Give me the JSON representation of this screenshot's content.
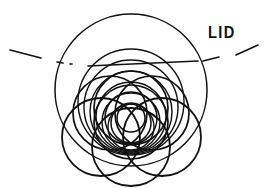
{
  "figure": {
    "title": "LID",
    "type": "technical-line-drawing",
    "background_color": "#ffffff",
    "ink_color": "#111111",
    "label": {
      "text": "LID",
      "x": 208,
      "y": 24,
      "font_size": 17,
      "weight": "bold"
    },
    "centerline": {
      "name": "dash-dot-centerline",
      "style": "dash-dot",
      "color": "#111111",
      "stroke_width": 1.6,
      "segments": [
        {
          "x1": 10,
          "y1": 50,
          "x2": 41,
          "y2": 58
        },
        {
          "x1": 57,
          "y1": 62,
          "x2": 63,
          "y2": 63
        },
        {
          "x1": 70,
          "y1": 64,
          "x2": 72,
          "y2": 64
        },
        {
          "x1": 88,
          "y1": 66,
          "x2": 198,
          "y2": 61
        },
        {
          "x1": 203,
          "y1": 61,
          "x2": 219,
          "y2": 57
        },
        {
          "x1": 236,
          "y1": 55,
          "x2": 258,
          "y2": 45
        }
      ]
    },
    "circles": [
      {
        "name": "outer-boundary-circle",
        "cx": 131,
        "cy": 90,
        "r": 76,
        "stroke_width": 1.5
      },
      {
        "name": "upper-nested-circle-1",
        "cx": 131,
        "cy": 102,
        "r": 53,
        "stroke_width": 1.4
      },
      {
        "name": "upper-nested-circle-2",
        "cx": 131,
        "cy": 107,
        "r": 47,
        "stroke_width": 1.4
      },
      {
        "name": "upper-nested-circle-3",
        "cx": 131,
        "cy": 112,
        "r": 41,
        "stroke_width": 1.4
      },
      {
        "name": "upper-nested-circle-4",
        "cx": 131,
        "cy": 117,
        "r": 35,
        "stroke_width": 1.4
      },
      {
        "name": "upper-nested-circle-5",
        "cx": 131,
        "cy": 122,
        "r": 29,
        "stroke_width": 1.4
      },
      {
        "name": "upper-nested-circle-6",
        "cx": 131,
        "cy": 127,
        "r": 23,
        "stroke_width": 1.4
      },
      {
        "name": "rosette-circle-top",
        "cx": 131,
        "cy": 108,
        "r": 37,
        "stroke_width": 1.7
      },
      {
        "name": "rosette-circle-upper-left",
        "cx": 110,
        "cy": 113,
        "r": 37,
        "stroke_width": 1.7
      },
      {
        "name": "rosette-circle-upper-right",
        "cx": 152,
        "cy": 113,
        "r": 37,
        "stroke_width": 1.7
      },
      {
        "name": "rosette-circle-center",
        "cx": 131,
        "cy": 122,
        "r": 37,
        "stroke_width": 1.7
      },
      {
        "name": "lower-trefoil-circle-left",
        "cx": 101,
        "cy": 137,
        "r": 39,
        "stroke_width": 1.8
      },
      {
        "name": "lower-trefoil-circle-right",
        "cx": 162,
        "cy": 137,
        "r": 39,
        "stroke_width": 1.8
      },
      {
        "name": "lower-trefoil-circle-bottom",
        "cx": 131,
        "cy": 147,
        "r": 39,
        "stroke_width": 1.8
      },
      {
        "name": "inner-small-circle-1",
        "cx": 131,
        "cy": 118,
        "r": 26,
        "stroke_width": 1.5
      },
      {
        "name": "inner-small-circle-2",
        "cx": 131,
        "cy": 123,
        "r": 20,
        "stroke_width": 1.5
      },
      {
        "name": "inner-ellipse-core",
        "cx": 131,
        "cy": 118,
        "r": 14,
        "stroke_width": 1.5
      }
    ]
  }
}
